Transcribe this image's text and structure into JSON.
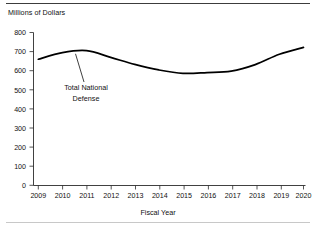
{
  "chart_data": {
    "type": "line",
    "title": "",
    "xlabel": "Fiscal Year",
    "ylabel": "Millions of Dollars",
    "categories": [
      "2009",
      "2010",
      "2011",
      "2012",
      "2013",
      "2014",
      "2015",
      "2016",
      "2017",
      "2018",
      "2019",
      "2020"
    ],
    "series": [
      {
        "name": "Total National Defense",
        "values": [
          660,
          695,
          705,
          670,
          633,
          604,
          586,
          590,
          598,
          632,
          686,
          722
        ]
      }
    ],
    "ylim": [
      0,
      800
    ],
    "ytick_labels": [
      "800",
      "700",
      "600",
      "500",
      "400",
      "300",
      "200",
      "100",
      "0"
    ],
    "ytick_values": [
      800,
      700,
      600,
      500,
      400,
      300,
      200,
      100,
      0
    ],
    "xtick_labels": [
      "2009",
      "2010",
      "2011",
      "2012",
      "2013",
      "2014",
      "2015",
      "2016",
      "2017",
      "2018",
      "2019",
      "2020"
    ],
    "grid": false,
    "legend_position": "none",
    "annotations": [
      {
        "name": "series-callout",
        "line1": "Total National",
        "line2": "Defense"
      }
    ]
  },
  "figure": {
    "y_axis_title": "Millions of Dollars",
    "x_axis_title": "Fiscal Year"
  }
}
